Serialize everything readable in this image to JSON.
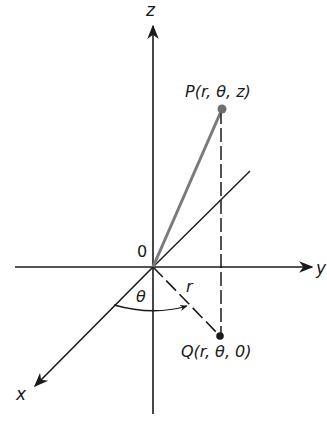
{
  "figure": {
    "labels": {
      "z_axis": "z",
      "y_axis": "y",
      "x_axis": "x",
      "origin": "0",
      "point_p": "P(r, θ, z)",
      "point_q": "Q(r, θ, 0)",
      "radius": "r",
      "angle": "θ"
    },
    "colors": {
      "ink": "#1a1a1a",
      "op_segment": "#7a7a7a",
      "point_p": "#6e6e6e",
      "point_q": "#1a1a1a",
      "background": "#ffffff"
    }
  }
}
